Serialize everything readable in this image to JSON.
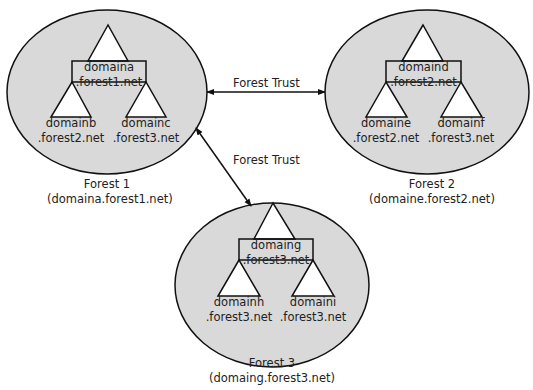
{
  "colors": {
    "forest_fill": "#d9d9d9",
    "stroke": "#111111",
    "triangle_fill": "#ffffff"
  },
  "forests": [
    {
      "name": "Forest 1",
      "root": "(domaina.forest1.net)",
      "domains": {
        "parent": [
          "domaina",
          ".forest1.net"
        ],
        "left": [
          "domainb",
          ".forest2.net"
        ],
        "right": [
          "domainc",
          ".forest3.net"
        ]
      }
    },
    {
      "name": "Forest 2",
      "root": "(domaine.forest2.net)",
      "domains": {
        "parent": [
          "domaind",
          ".forest2.net"
        ],
        "left": [
          "domaine",
          ".forest2.net"
        ],
        "right": [
          "domainf",
          ".forest3.net"
        ]
      }
    },
    {
      "name": "Forest 3",
      "root": "(domaing.forest3.net)",
      "domains": {
        "parent": [
          "domaing",
          ".forest3.net"
        ],
        "left": [
          "domainh",
          ".forest3.net"
        ],
        "right": [
          "domaini",
          ".forest3.net"
        ]
      }
    }
  ],
  "trusts": [
    {
      "label": "Forest Trust",
      "from": "Forest 1",
      "to": "Forest 2"
    },
    {
      "label": "Forest Trust",
      "from": "Forest 1",
      "to": "Forest 3"
    }
  ]
}
